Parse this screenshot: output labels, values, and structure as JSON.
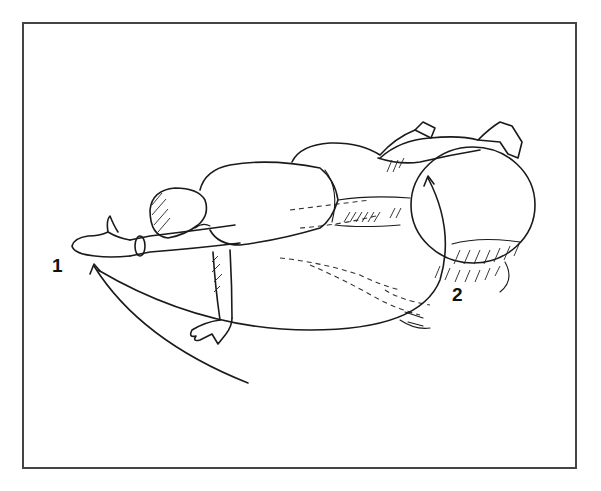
{
  "figure": {
    "labels": {
      "position_1": "1",
      "position_2": "2"
    },
    "icons": [
      "curved-arrow-icon",
      "curved-arrow-icon"
    ],
    "colors": {
      "ink": "#1a1a1a",
      "frame": "#444444",
      "background": "#ffffff"
    }
  }
}
